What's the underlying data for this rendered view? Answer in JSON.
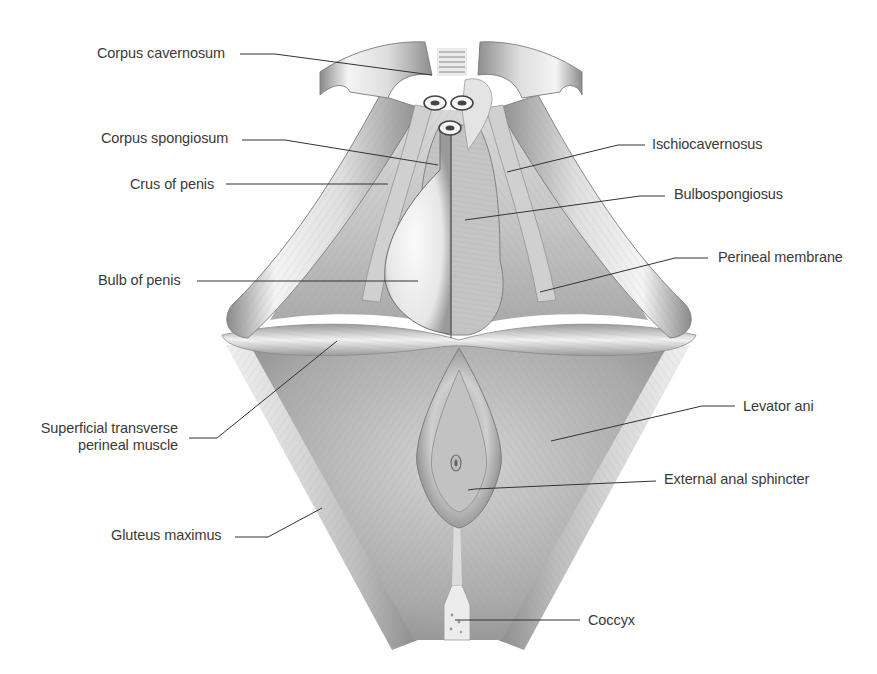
{
  "figure": {
    "colors": {
      "label_text": "#3a3a3a",
      "leader_line": "#333333",
      "muscle_light": "#f2f2f2",
      "muscle_mid": "#bdbdbd",
      "muscle_dark": "#7a7a7a"
    }
  },
  "labels": [
    {
      "id": "corpus-cavernosum",
      "text": "Corpus cavernosum",
      "side": "left",
      "x": 97,
      "y": 45,
      "line": [
        [
          240,
          54
        ],
        [
          275,
          54
        ],
        [
          432,
          75
        ]
      ]
    },
    {
      "id": "corpus-spongiosum",
      "text": "Corpus spongiosum",
      "side": "left",
      "x": 101,
      "y": 130,
      "line": [
        [
          242,
          140
        ],
        [
          285,
          140
        ],
        [
          438,
          165
        ]
      ]
    },
    {
      "id": "crus-of-penis",
      "text": "Crus of penis",
      "side": "left",
      "x": 130,
      "y": 176,
      "line": [
        [
          226,
          184
        ],
        [
          388,
          184
        ]
      ]
    },
    {
      "id": "bulb-of-penis",
      "text": "Bulb of penis",
      "side": "left",
      "x": 98,
      "y": 272,
      "line": [
        [
          197,
          281
        ],
        [
          418,
          281
        ]
      ]
    },
    {
      "id": "superficial-transverse-perineal-muscle",
      "text_lines": [
        "Superficial transverse",
        "perineal muscle"
      ],
      "side": "left",
      "x": 36,
      "y": 420,
      "line": [
        [
          189,
          438
        ],
        [
          217,
          438
        ],
        [
          337,
          341
        ]
      ]
    },
    {
      "id": "gluteus-maximus",
      "text": "Gluteus maximus",
      "side": "left",
      "x": 111,
      "y": 527,
      "line": [
        [
          235,
          537
        ],
        [
          268,
          537
        ],
        [
          322,
          508
        ]
      ]
    },
    {
      "id": "ischiocavernosus",
      "text": "Ischiocavernosus",
      "side": "right",
      "x": 652,
      "y": 136,
      "line": [
        [
          645,
          145
        ],
        [
          618,
          145
        ],
        [
          507,
          172
        ]
      ]
    },
    {
      "id": "bulbospongiosus",
      "text": "Bulbospongiosus",
      "side": "right",
      "x": 674,
      "y": 186,
      "line": [
        [
          665,
          196
        ],
        [
          640,
          196
        ],
        [
          465,
          220
        ]
      ]
    },
    {
      "id": "perineal-membrane",
      "text": "Perineal membrane",
      "side": "right",
      "x": 718,
      "y": 249,
      "line": [
        [
          708,
          258
        ],
        [
          675,
          258
        ],
        [
          540,
          292
        ]
      ]
    },
    {
      "id": "levator-ani",
      "text": "Levator ani",
      "side": "right",
      "x": 743,
      "y": 398,
      "line": [
        [
          735,
          406
        ],
        [
          702,
          406
        ],
        [
          551,
          441
        ]
      ]
    },
    {
      "id": "external-anal-sphincter",
      "text": "External anal sphincter",
      "side": "right",
      "x": 664,
      "y": 471,
      "line": [
        [
          656,
          481
        ],
        [
          475,
          489
        ],
        [
          468,
          490
        ]
      ]
    },
    {
      "id": "coccyx",
      "text": "Coccyx",
      "side": "right",
      "x": 588,
      "y": 612,
      "line": [
        [
          580,
          620
        ],
        [
          455,
          620
        ]
      ]
    }
  ]
}
